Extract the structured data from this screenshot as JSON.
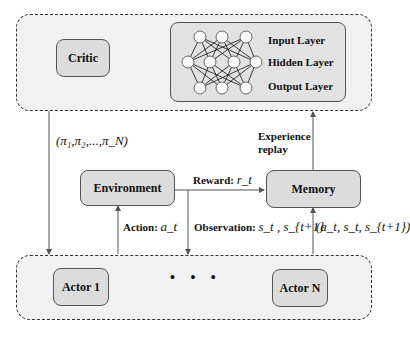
{
  "diagram": {
    "type": "multi-agent actor-critic reinforcement learning architecture",
    "top_group": {
      "critic": {
        "label": "Critic"
      },
      "neural_network": {
        "layers": [
          {
            "label": "Input Layer",
            "nodes": 3
          },
          {
            "label": "Hidden Layer",
            "nodes": 4
          },
          {
            "label": "Output Layer",
            "nodes": 3
          }
        ]
      }
    },
    "middle": {
      "environment": {
        "label": "Environment"
      },
      "memory": {
        "label": "Memory"
      },
      "policy_label": "(π₁,π₂,...,π_N)",
      "reward_label": "Reward:",
      "reward_symbol": "r_t",
      "experience_replay_label_line1": "Experience",
      "experience_replay_label_line2": "replay",
      "action_label": "Action:",
      "action_symbol": "a_t",
      "observation_label": "Observation:",
      "observation_symbol": "s_t , s_{t+1}",
      "transition_label": "(a_t, s_t, s_{t+1})"
    },
    "bottom_group": {
      "actor_first": {
        "label": "Actor 1"
      },
      "ellipsis": "• • •",
      "actor_last": {
        "label": "Actor N"
      }
    },
    "colors": {
      "group_bg": "#f1f1f1",
      "box_bg": "#dcdcdc",
      "border": "#333333",
      "arrow": "#555555"
    }
  }
}
